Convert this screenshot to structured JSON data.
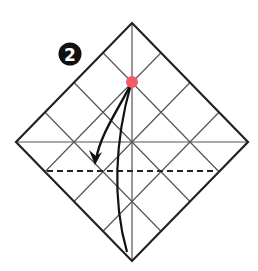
{
  "diagram": {
    "step_number": "2",
    "colors": {
      "outline": "#222222",
      "grid": "#444444",
      "marker": "#f25b67",
      "badge_bg": "#111111",
      "badge_fg": "#ffffff"
    },
    "square": {
      "top": [
        132,
        23
      ],
      "right": [
        248,
        142
      ],
      "bottom": [
        132,
        261
      ],
      "left": [
        16,
        142
      ]
    },
    "marker_point": [
      132,
      82
    ],
    "fold_line": {
      "type": "valley-dashed",
      "y": 171,
      "x_start": 47,
      "x_end": 214
    }
  }
}
